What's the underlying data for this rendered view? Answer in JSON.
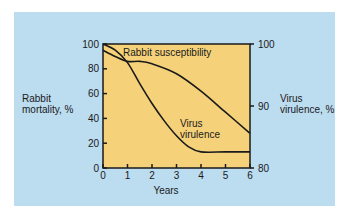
{
  "chart_data": {
    "type": "line",
    "title": "",
    "xlabel": "Years",
    "ylabel_left": "Rabbit mortality, %",
    "ylabel_right": "Virus virulence, %",
    "x_ticks": [
      "0",
      "1",
      "2",
      "3",
      "4",
      "5",
      "6"
    ],
    "y_left_ticks": [
      "0",
      "20",
      "40",
      "60",
      "80",
      "100"
    ],
    "y_right_ticks": [
      "80",
      "90",
      "100"
    ],
    "xlim": [
      0,
      6
    ],
    "ylim_left": [
      0,
      100
    ],
    "ylim_right": [
      80,
      100
    ],
    "grid": false,
    "series": [
      {
        "name": "Rabbit susceptibility",
        "axis": "left",
        "x": [
          0,
          0.5,
          1,
          1.5,
          2,
          3,
          4,
          5,
          6
        ],
        "values": [
          95,
          90,
          86,
          86,
          84,
          76,
          62,
          45,
          28
        ]
      },
      {
        "name": "Virus virulence",
        "axis": "left",
        "x": [
          0,
          0.5,
          1,
          1.5,
          2,
          2.5,
          3,
          3.5,
          4,
          5,
          6
        ],
        "values": [
          100,
          95,
          85,
          68,
          52,
          38,
          26,
          17,
          13,
          13,
          13
        ]
      }
    ],
    "annotations": [
      "Rabbit susceptibility",
      "Virus virulence"
    ],
    "colors": {
      "panel": "#bcdcf0",
      "plot": "#f5d27a",
      "line": "#1a1a1a"
    }
  }
}
